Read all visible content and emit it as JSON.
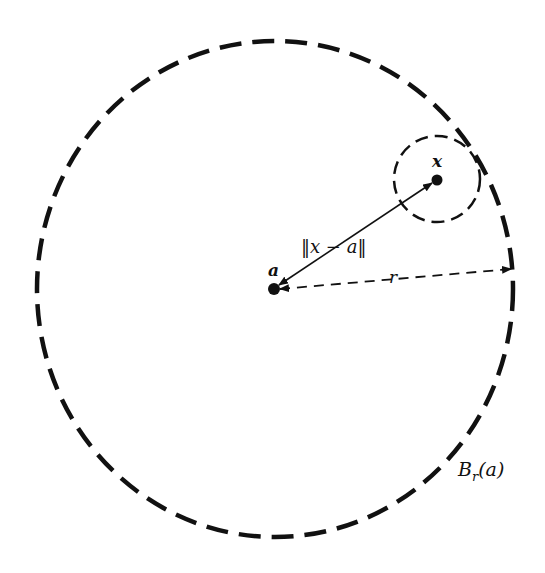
{
  "diagram": {
    "colors": {
      "stroke": "#111111",
      "background": "#ffffff"
    },
    "big_ball": {
      "label": "B",
      "label_sub": "r",
      "label_arg": "(a)",
      "cx": 275,
      "cy": 289,
      "rx": 238,
      "ry": 248
    },
    "small_ball": {
      "cx": 437,
      "cy": 179,
      "r": 43
    },
    "points": [
      {
        "name": "a",
        "label": "a",
        "x": 274,
        "y": 289
      },
      {
        "name": "x",
        "label": "x",
        "x": 437,
        "y": 180
      }
    ],
    "distance_label": {
      "text": "‖x − a‖"
    },
    "radius_label": {
      "text": "r"
    }
  }
}
